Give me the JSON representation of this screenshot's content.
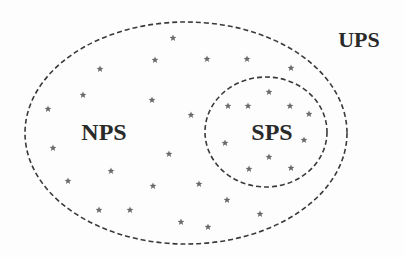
{
  "diagram": {
    "type": "venn-nested-sets",
    "sets": [
      {
        "id": "ups",
        "label": "UPS",
        "label_pos": [
          359,
          47
        ],
        "shape": "none"
      },
      {
        "id": "nps",
        "label": "NPS",
        "label_pos": [
          104,
          140
        ],
        "ellipse": {
          "cx": 186,
          "cy": 133,
          "rx": 161,
          "ry": 111
        }
      },
      {
        "id": "sps",
        "label": "SPS",
        "label_pos": [
          272,
          140
        ],
        "ellipse": {
          "cx": 266,
          "cy": 132,
          "rx": 61,
          "ry": 55
        }
      }
    ],
    "style": {
      "stroke_color": "#3a3a3a",
      "star_color": "#6a6a6a",
      "label_color": "#2a2a2a",
      "dash": "5,3"
    },
    "points": [
      [
        173,
        38
      ],
      [
        155,
        60
      ],
      [
        207,
        59
      ],
      [
        247,
        59
      ],
      [
        100,
        69
      ],
      [
        291,
        68
      ],
      [
        83,
        95
      ],
      [
        48,
        109
      ],
      [
        152,
        100
      ],
      [
        191,
        115
      ],
      [
        269,
        92
      ],
      [
        228,
        106
      ],
      [
        248,
        106
      ],
      [
        290,
        106
      ],
      [
        309,
        114
      ],
      [
        225,
        143
      ],
      [
        304,
        140
      ],
      [
        269,
        157
      ],
      [
        249,
        169
      ],
      [
        291,
        168
      ],
      [
        53,
        148
      ],
      [
        169,
        154
      ],
      [
        111,
        171
      ],
      [
        68,
        181
      ],
      [
        153,
        186
      ],
      [
        199,
        184
      ],
      [
        99,
        210
      ],
      [
        130,
        210
      ],
      [
        181,
        222
      ],
      [
        227,
        200
      ],
      [
        260,
        214
      ],
      [
        208,
        227
      ]
    ]
  }
}
